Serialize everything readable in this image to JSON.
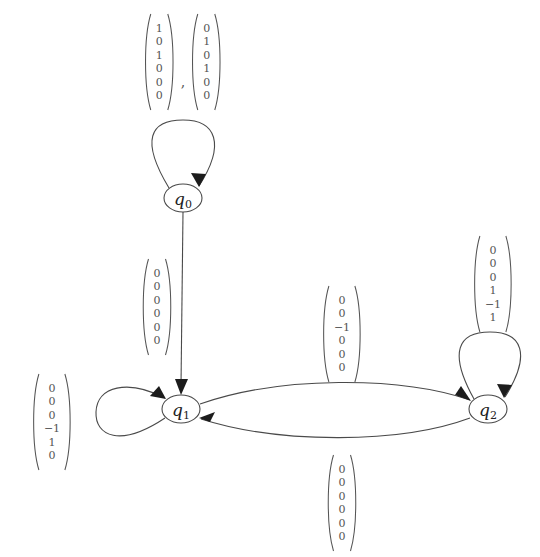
{
  "diagram": {
    "type": "state-transition-graph",
    "title": "",
    "background_color": "#ffffff",
    "stroke_color": "#4a4a4a",
    "text_color": "#555555",
    "states": [
      {
        "id": "q0",
        "label": "q",
        "subscript": "0",
        "cx": 183,
        "cy": 198,
        "rx": 19,
        "ry": 14
      },
      {
        "id": "q1",
        "label": "q",
        "subscript": "1",
        "cx": 181,
        "cy": 409,
        "rx": 19,
        "ry": 14
      },
      {
        "id": "q2",
        "label": "q",
        "subscript": "2",
        "cx": 488,
        "cy": 409,
        "rx": 19,
        "ry": 14
      }
    ],
    "transitions": [
      {
        "id": "t-q0-self",
        "from": "q0",
        "to": "q0",
        "kind": "self-loop",
        "loop_direction": "up",
        "label_position": {
          "x": 183,
          "y": 62
        },
        "labels": [
          {
            "entries": [
              "0",
              "0",
              "0",
              "0",
              "0",
              "0"
            ]
          },
          {
            "entries": [
              "0",
              "0",
              "0",
              "0",
              "0",
              "0"
            ]
          }
        ],
        "label_style": "pair"
      },
      {
        "id": "t-q0-q1",
        "from": "q0",
        "to": "q1",
        "kind": "straight",
        "label_position": {
          "x": 157,
          "y": 307
        },
        "labels": [
          {
            "entries": [
              "0",
              "0",
              "0",
              "0",
              "0",
              "0"
            ]
          }
        ],
        "label_style": "single"
      },
      {
        "id": "t-q1-self",
        "from": "q1",
        "to": "q1",
        "kind": "self-loop",
        "loop_direction": "left",
        "label_position": {
          "x": 52,
          "y": 422
        },
        "labels": [
          {
            "entries": [
              "0",
              "0",
              "0",
              "−1",
              "1",
              "0"
            ]
          }
        ],
        "label_style": "single"
      },
      {
        "id": "t-q1-q2",
        "from": "q1",
        "to": "q2",
        "kind": "curve-upper",
        "label_position": {
          "x": 342,
          "y": 334
        },
        "labels": [
          {
            "entries": [
              "0",
              "0",
              "−1",
              "0",
              "0",
              "0"
            ]
          }
        ],
        "label_style": "single"
      },
      {
        "id": "t-q2-q1",
        "from": "q2",
        "to": "q1",
        "kind": "curve-lower",
        "label_position": {
          "x": 342,
          "y": 503
        },
        "labels": [
          {
            "entries": [
              "0",
              "0",
              "0",
              "0",
              "0",
              "0"
            ]
          }
        ],
        "label_style": "single"
      },
      {
        "id": "t-q2-self",
        "from": "q2",
        "to": "q2",
        "kind": "self-loop",
        "loop_direction": "up",
        "label_position": {
          "x": 493,
          "y": 284
        },
        "labels": [
          {
            "entries": [
              "0",
              "0",
              "0",
              "1",
              "−1",
              "1"
            ]
          }
        ],
        "label_style": "single"
      }
    ],
    "labels": {
      "top_pair_first": {
        "entries": [
          "1",
          "0",
          "1",
          "0",
          "0",
          "0"
        ]
      },
      "top_pair_second": {
        "entries": [
          "0",
          "1",
          "0",
          "1",
          "0",
          "0"
        ]
      },
      "comma": ",",
      "q0_to_q1": {
        "entries": [
          "0",
          "0",
          "0",
          "0",
          "0",
          "0"
        ]
      },
      "q1_self": {
        "entries": [
          "0",
          "0",
          "0",
          "−1",
          "1",
          "0"
        ]
      },
      "q1_to_q2": {
        "entries": [
          "0",
          "0",
          "−1",
          "0",
          "0",
          "0"
        ]
      },
      "q2_to_q1": {
        "entries": [
          "0",
          "0",
          "0",
          "0",
          "0",
          "0"
        ]
      },
      "q2_self": {
        "entries": [
          "0",
          "0",
          "0",
          "1",
          "−1",
          "1"
        ]
      }
    }
  }
}
